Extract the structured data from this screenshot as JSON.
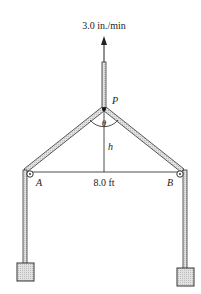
{
  "diagram": {
    "velocity_label": "3.0 in./min",
    "point_p": "P",
    "angle_label": "θ",
    "height_label": "h",
    "pulley_a": "A",
    "pulley_b": "B",
    "span_label": "8.0 ft"
  },
  "colors": {
    "rope": "#333333",
    "rope_fill": "#cfcfcf",
    "block_fill": "#d9d9d9",
    "line": "#222222"
  }
}
